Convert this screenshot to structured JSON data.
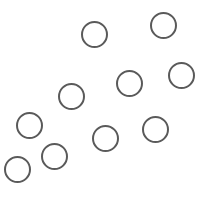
{
  "canvas": {
    "width": 207,
    "height": 198,
    "background": "#ffffff"
  },
  "style": {
    "stroke_color": "#5a5a5a",
    "stroke_width": 2.4,
    "radius": 13.5
  },
  "circles": [
    {
      "id": 1,
      "cx": 94,
      "cy": 34
    },
    {
      "id": 2,
      "cx": 163,
      "cy": 25
    },
    {
      "id": 3,
      "cx": 129,
      "cy": 83
    },
    {
      "id": 4,
      "cx": 181,
      "cy": 75
    },
    {
      "id": 5,
      "cx": 71,
      "cy": 96
    },
    {
      "id": 6,
      "cx": 29,
      "cy": 125
    },
    {
      "id": 7,
      "cx": 105,
      "cy": 138
    },
    {
      "id": 8,
      "cx": 155,
      "cy": 129
    },
    {
      "id": 9,
      "cx": 54,
      "cy": 156
    },
    {
      "id": 10,
      "cx": 17,
      "cy": 169
    }
  ]
}
